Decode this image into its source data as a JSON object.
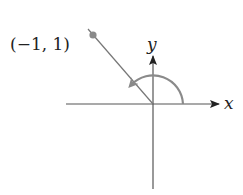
{
  "diagram": {
    "type": "angle-on-unit-axes",
    "point_label": "(−1, 1)",
    "x_axis_label": "x",
    "y_axis_label": "y",
    "colors": {
      "axes": "#333333",
      "terminal_ray": "#777777",
      "point": "#888888",
      "arc": "#8a8a8a",
      "text": "#222222"
    }
  }
}
